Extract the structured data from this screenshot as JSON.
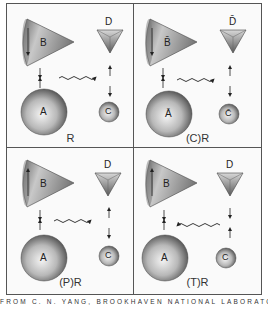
{
  "figure": {
    "caption": "FROM C. N. YANG, BROOKHAVEN NATIONAL LABORATORY LECTURES",
    "colors": {
      "border": "#555555",
      "shape_light": "#f2f2f2",
      "shape_dark": "#555555",
      "text": "#333333"
    },
    "panels": [
      {
        "id": "R",
        "label": "R",
        "objects": {
          "cone": "B",
          "triangle": "D",
          "big_sphere": "A",
          "small_sphere": "C"
        },
        "wave_direction": "right",
        "cone_arrow": "down"
      },
      {
        "id": "CR",
        "label": "(C)R",
        "objects": {
          "cone": "B̄",
          "triangle": "D̄",
          "big_sphere": "Ā",
          "small_sphere": "C̄"
        },
        "wave_direction": "right",
        "cone_arrow": "down"
      },
      {
        "id": "PR",
        "label": "(P)R",
        "objects": {
          "cone": "B",
          "triangle": "D",
          "big_sphere": "A",
          "small_sphere": "C"
        },
        "wave_direction": "right",
        "cone_arrow": "up"
      },
      {
        "id": "TR",
        "label": "(T)R",
        "objects": {
          "cone": "B",
          "triangle": "D",
          "big_sphere": "A",
          "small_sphere": "C"
        },
        "wave_direction": "left",
        "cone_arrow": "up"
      }
    ]
  }
}
